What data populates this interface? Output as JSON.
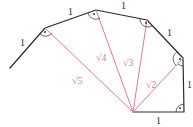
{
  "diagram": {
    "colors": {
      "edge": "#2b2b2b",
      "spoke": "#e07a9e"
    },
    "edge_labels": [
      "1",
      "1",
      "1",
      "1",
      "1",
      "1"
    ],
    "spoke_labels": [
      "√2",
      "√3",
      "√4",
      "√5"
    ],
    "right_angle_marker": "right-angle-arc-with-dot"
  }
}
